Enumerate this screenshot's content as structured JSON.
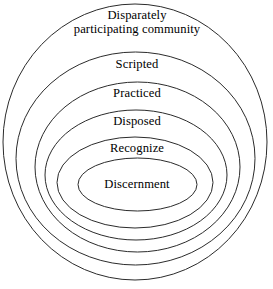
{
  "diagram": {
    "type": "nested-concentric-ellipses",
    "title": "",
    "background_color": "#ffffff",
    "stroke_color": "#2b2b2b",
    "text_color": "#000000",
    "stroke_width": 1,
    "canvas": {
      "width": 273,
      "height": 289
    },
    "rings": [
      {
        "index": 0,
        "name": "outermost-ring",
        "label": "Disparately\nparticipating community",
        "label_lines": [
          "Disparately",
          "participating community"
        ],
        "ellipse": {
          "cx": 135,
          "cy": 142,
          "rx": 132,
          "ry": 138
        }
      },
      {
        "index": 1,
        "name": "ring-scripted",
        "label": "Scripted",
        "label_lines": [
          "Scripted"
        ],
        "ellipse": {
          "cx": 135.5,
          "cy": 158.5,
          "rx": 119.5,
          "ry": 106.5
        }
      },
      {
        "index": 2,
        "name": "ring-practiced",
        "label": "Practiced",
        "label_lines": [
          "Practiced"
        ],
        "ellipse": {
          "cx": 137.5,
          "cy": 167,
          "rx": 102.5,
          "ry": 85
        }
      },
      {
        "index": 3,
        "name": "ring-disposed",
        "label": "Disposed",
        "label_lines": [
          "Disposed"
        ],
        "ellipse": {
          "cx": 136,
          "cy": 175,
          "rx": 91,
          "ry": 65
        }
      },
      {
        "index": 4,
        "name": "ring-recognize",
        "label": "Recognize",
        "label_lines": [
          "Recognize"
        ],
        "ellipse": {
          "cx": 135,
          "cy": 182.5,
          "rx": 78,
          "ry": 45.5
        }
      },
      {
        "index": 5,
        "name": "innermost-ring-discernment",
        "label": "Discernment",
        "label_lines": [
          "Discernment"
        ],
        "ellipse": {
          "cx": 137.5,
          "cy": 184.5,
          "rx": 59.5,
          "ry": 26.5
        }
      }
    ]
  }
}
